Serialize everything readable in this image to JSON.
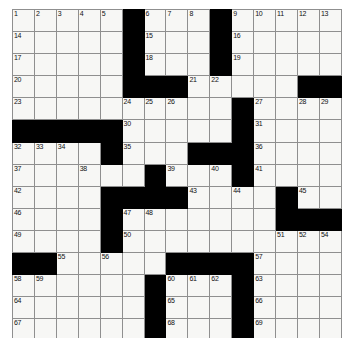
{
  "puzzle": {
    "title": "Crossword Grid",
    "rows": 15,
    "cols": 15,
    "cell_size_px": 21,
    "colors": {
      "block": "#000000",
      "cell": "#f7f7f5",
      "grid_line": "#8f8f8f",
      "border": "#3a3a3a",
      "number_text": "#111111",
      "page_background": "#ffffff"
    },
    "grid": [
      [
        "1",
        "2",
        "3",
        "4",
        "5",
        "#",
        "6",
        "7",
        "8",
        "#",
        "9",
        "10",
        "11",
        "12",
        "13"
      ],
      [
        "14",
        "",
        "",
        "",
        "",
        "#",
        "15",
        "",
        "",
        "#",
        "16",
        "",
        "",
        "",
        ""
      ],
      [
        "17",
        "",
        "",
        "",
        "",
        "#",
        "18",
        "",
        "",
        "#",
        "19",
        "",
        "",
        "",
        ""
      ],
      [
        "20",
        "",
        "",
        "",
        "",
        "#",
        "#",
        "#",
        "21",
        "22",
        "",
        "",
        "",
        "#",
        "#"
      ],
      [
        "23",
        "",
        "",
        "",
        "",
        "24",
        "25",
        "26",
        "",
        "",
        "#",
        "27",
        "",
        "28",
        "29"
      ],
      [
        "#",
        "#",
        "#",
        "#",
        "#",
        "30",
        "",
        "",
        "",
        "",
        "",
        "31",
        "",
        "",
        ""
      ],
      [
        "32",
        "33",
        "34",
        "",
        "#",
        "35",
        "",
        "",
        "#",
        "#",
        "#",
        "36",
        "",
        "",
        ""
      ],
      [
        "37",
        "",
        "",
        "38",
        "",
        "",
        "#",
        "39",
        "",
        "40",
        "#",
        "41",
        "",
        "",
        ""
      ],
      [
        "42",
        "",
        "",
        "",
        "#",
        "#",
        "#",
        "#",
        "43",
        "",
        "44",
        "",
        "#",
        "45",
        ""
      ],
      [
        "46",
        "",
        "",
        "",
        "#",
        "47",
        "48",
        "",
        "",
        "",
        "",
        "",
        "#",
        "#",
        "#"
      ],
      [
        "49",
        "",
        "",
        "",
        "#",
        "50",
        "",
        "",
        "",
        "",
        "",
        "",
        "51",
        "52",
        "53"
      ],
      [
        "#",
        "#",
        "55",
        "",
        "56",
        "",
        "",
        "#",
        "#",
        "#",
        "#",
        "57",
        "",
        "",
        ""
      ],
      [
        "58",
        "59",
        "",
        "",
        "",
        "",
        "#",
        "60",
        "61",
        "62",
        "#",
        "63",
        "",
        "",
        ""
      ],
      [
        "64",
        "",
        "",
        "",
        "",
        "",
        "#",
        "65",
        "",
        "",
        "#",
        "66",
        "",
        "",
        ""
      ],
      [
        "67",
        "",
        "",
        "",
        "",
        "",
        "#",
        "68",
        "",
        "",
        "#",
        "69",
        "",
        "",
        ""
      ]
    ],
    "numbers": [
      1,
      2,
      3,
      4,
      5,
      6,
      7,
      8,
      9,
      10,
      11,
      12,
      13,
      14,
      15,
      16,
      17,
      18,
      19,
      20,
      21,
      22,
      23,
      24,
      25,
      26,
      27,
      28,
      29,
      30,
      31,
      32,
      33,
      34,
      35,
      36,
      37,
      38,
      39,
      40,
      41,
      42,
      43,
      44,
      45,
      46,
      47,
      48,
      49,
      50,
      51,
      52,
      53,
      54,
      55,
      56,
      57,
      58,
      59,
      60,
      61,
      62,
      63,
      64,
      65,
      66,
      67,
      68,
      69
    ],
    "layout": [
      {
        "row": 0,
        "blocks": [
          5,
          9
        ],
        "nums": {
          "0": "1",
          "1": "2",
          "2": "3",
          "3": "4",
          "4": "5",
          "6": "6",
          "7": "7",
          "8": "8",
          "10": "9",
          "11": "10",
          "12": "11",
          "13": "12",
          "14": "13"
        }
      },
      {
        "row": 1,
        "blocks": [
          5,
          9
        ],
        "nums": {
          "0": "14",
          "6": "15",
          "10": "16"
        }
      },
      {
        "row": 2,
        "blocks": [
          5,
          9
        ],
        "nums": {
          "0": "17",
          "6": "18",
          "10": "19"
        }
      },
      {
        "row": 3,
        "blocks": [
          5,
          6,
          7,
          13,
          14
        ],
        "nums": {
          "0": "20",
          "8": "21",
          "9": "22"
        }
      },
      {
        "row": 4,
        "blocks": [
          10
        ],
        "nums": {
          "0": "23",
          "5": "24",
          "6": "25",
          "7": "26",
          "11": "27",
          "13": "28",
          "14": "29"
        }
      },
      {
        "row": 5,
        "blocks": [
          0,
          1,
          2,
          3,
          4,
          10
        ],
        "nums": {
          "5": "30",
          "11": "31"
        }
      },
      {
        "row": 6,
        "blocks": [
          4,
          8,
          9,
          10
        ],
        "nums": {
          "0": "32",
          "1": "33",
          "2": "34",
          "5": "35",
          "11": "36"
        }
      },
      {
        "row": 7,
        "blocks": [
          6,
          10
        ],
        "nums": {
          "0": "37",
          "3": "38",
          "7": "39",
          "9": "40",
          "11": "41"
        }
      },
      {
        "row": 8,
        "blocks": [
          4,
          5,
          6,
          7,
          12
        ],
        "nums": {
          "0": "42",
          "8": "43",
          "10": "44",
          "13": "45"
        }
      },
      {
        "row": 9,
        "blocks": [
          4,
          12,
          13,
          14
        ],
        "nums": {
          "0": "46",
          "5": "47",
          "6": "48"
        }
      },
      {
        "row": 10,
        "blocks": [
          4
        ],
        "nums": {
          "0": "49",
          "5": "50",
          "12": "51",
          "13": "52",
          "14": "53"
        }
      },
      {
        "row": 11,
        "blocks": [
          0,
          1,
          7,
          8,
          9,
          10
        ],
        "nums": {
          "2": "55",
          "4": "56",
          "11": "57"
        }
      },
      {
        "row": 12,
        "blocks": [
          6,
          10
        ],
        "nums": {
          "0": "58",
          "1": "59",
          "7": "60",
          "8": "61",
          "9": "62",
          "11": "63"
        }
      },
      {
        "row": 13,
        "blocks": [
          6,
          10
        ],
        "nums": {
          "0": "64",
          "7": "65",
          "11": "66"
        }
      },
      {
        "row": 14,
        "blocks": [
          6,
          10
        ],
        "nums": {
          "0": "67",
          "7": "68",
          "11": "69"
        }
      }
    ],
    "extra_numbers": {
      "note_54_cell": {
        "row": 10,
        "col": 14,
        "label": "54"
      }
    }
  }
}
